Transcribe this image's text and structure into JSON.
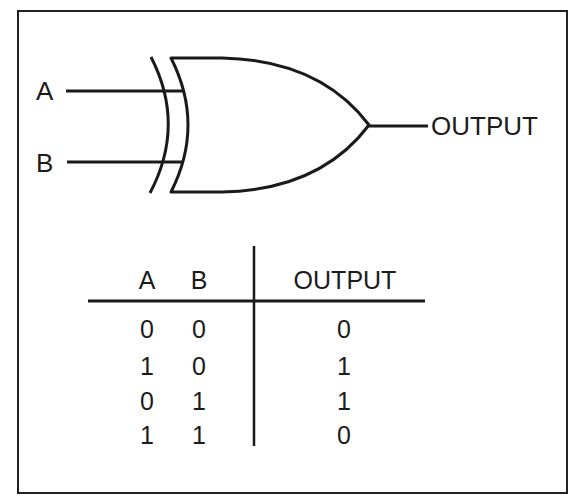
{
  "diagram": {
    "gate_type": "XOR",
    "inputs": [
      {
        "label": "A"
      },
      {
        "label": "B"
      }
    ],
    "output": {
      "label": "OUTPUT"
    },
    "colors": {
      "stroke": "#1a1a1a",
      "background": "#ffffff",
      "frame": "#222222"
    }
  },
  "truth_table": {
    "headers": [
      "A",
      "B",
      "OUTPUT"
    ],
    "rows": [
      [
        "0",
        "0",
        "0"
      ],
      [
        "1",
        "0",
        "1"
      ],
      [
        "0",
        "1",
        "1"
      ],
      [
        "1",
        "1",
        "0"
      ]
    ]
  }
}
